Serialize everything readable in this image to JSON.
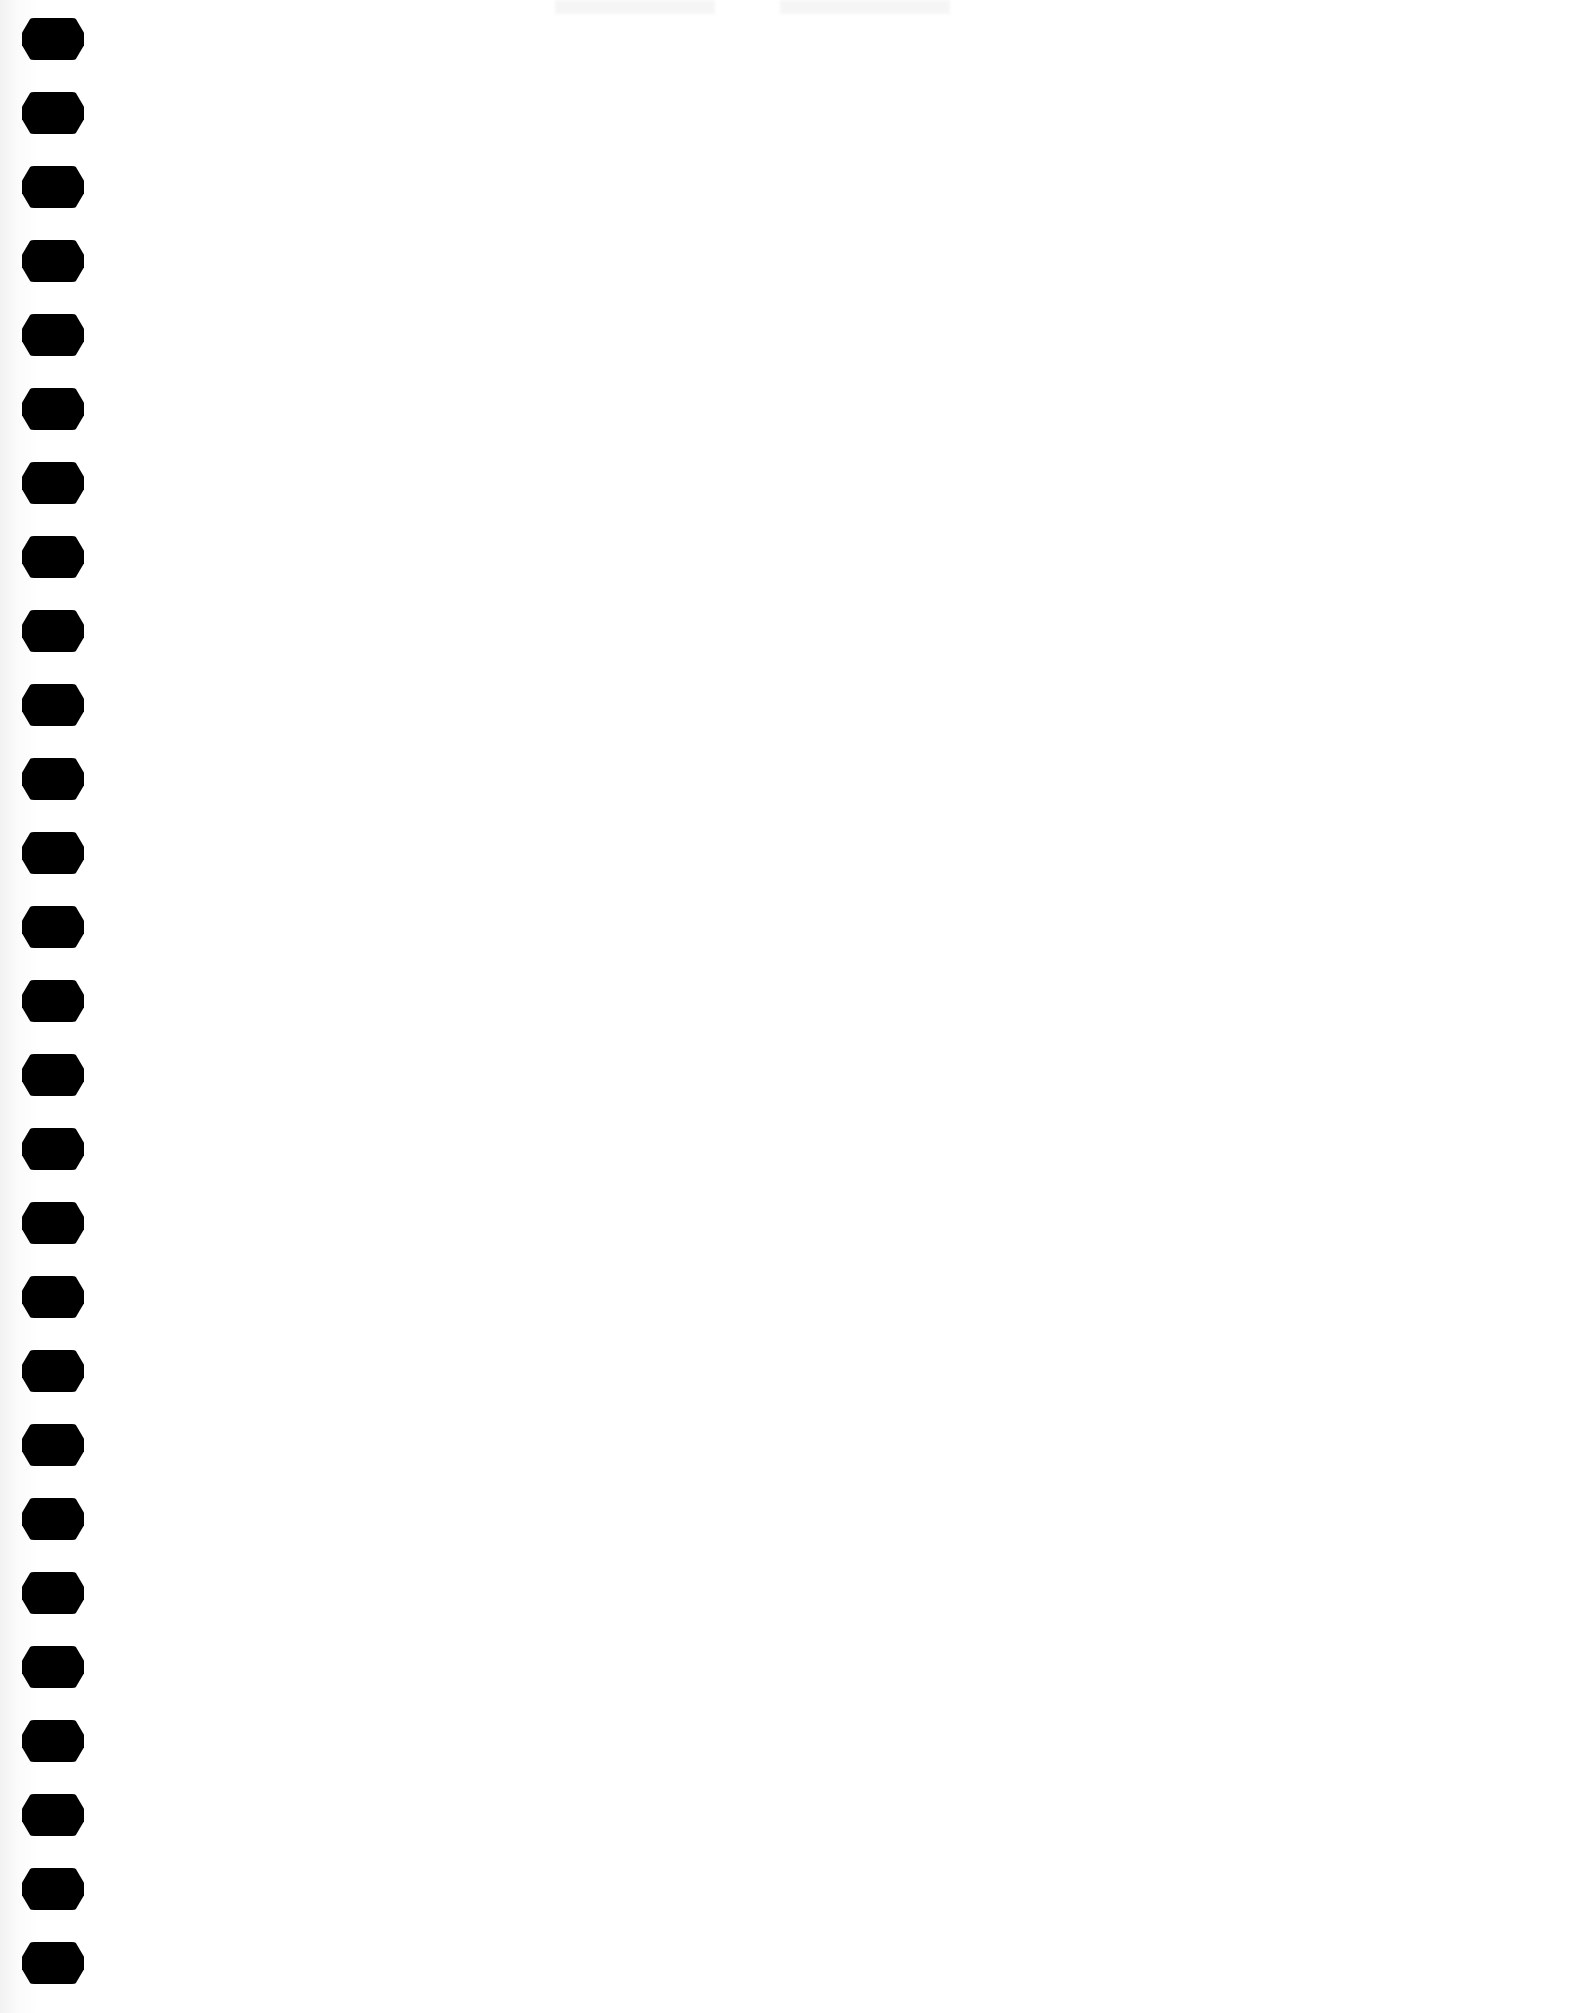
{
  "page": {
    "type": "spiral-notebook-sheet",
    "background": "#ffffff",
    "hole_color": "#000000",
    "hole_count": 27,
    "content": ""
  },
  "bleed_through": {
    "left": "",
    "right": ""
  }
}
